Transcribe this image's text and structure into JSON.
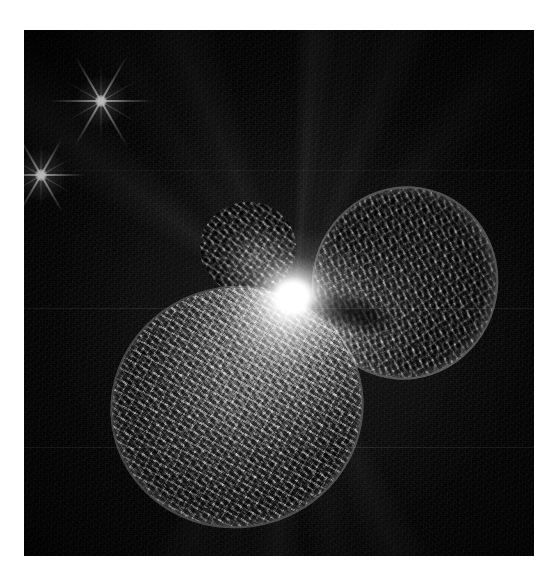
{
  "page": {
    "background_color": "#ffffff",
    "width": 549,
    "height": 582
  },
  "figure": {
    "name": "astronomical-image-plate",
    "object_name": "Homunculus Nebula (Eta Carinae)",
    "image_type": "greyscale astronomical exposure",
    "caption": "",
    "plate": {
      "left": 24,
      "top": 30,
      "width": 510,
      "height": 526,
      "background_color": "#080808",
      "border_color": "#ffffff"
    }
  },
  "features": {
    "core": {
      "label": "central bright core",
      "center_x": 294,
      "center_y": 297,
      "color": "#ffffff"
    },
    "lobe_sw": {
      "label": "south-west lobe",
      "center_x": 213,
      "center_y": 377,
      "shape": "round mottled shell"
    },
    "lobe_ne": {
      "label": "north-east lobe",
      "center_x": 381,
      "center_y": 253,
      "shape": "round mottled shell with bright rim"
    },
    "knot_upper": {
      "label": "upper condensation knot",
      "center_x": 224,
      "center_y": 218
    },
    "dark_lane": {
      "label": "dark equatorial lane",
      "center_x": 360,
      "center_y": 315,
      "color": "#000000"
    },
    "rays": {
      "label": "radial jet rays",
      "count": 8,
      "origin_x": 294,
      "origin_y": 297
    },
    "stars": [
      {
        "label": "field star with diffraction spikes",
        "center_x": 101,
        "center_y": 101,
        "spike_count": 6,
        "color": "#ffffff"
      },
      {
        "label": "field star with diffraction spikes",
        "center_x": 41,
        "center_y": 175,
        "spike_count": 6,
        "color": "#ffffff"
      }
    ],
    "scanlines": [
      {
        "label": "horizontal scan artefact",
        "y": 308
      },
      {
        "label": "horizontal scan artefact",
        "y": 447
      },
      {
        "label": "horizontal scan artefact",
        "y": 170
      }
    ]
  },
  "palette": {
    "sky": "#0a0a0a",
    "nebula_mid": "#8c8c8c",
    "highlight": "#ffffff",
    "shadow": "#000000",
    "page": "#ffffff"
  }
}
